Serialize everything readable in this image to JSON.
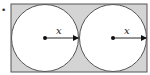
{
  "diagram": {
    "type": "geometry",
    "bullet": "•",
    "rectangle": {
      "fill": "#d4d4d4",
      "stroke": "#555555"
    },
    "circles": [
      {
        "id": "left",
        "fill": "#ffffff",
        "stroke": "#555555",
        "radius_label": "x"
      },
      {
        "id": "right",
        "fill": "#ffffff",
        "stroke": "#555555",
        "radius_label": "x"
      }
    ]
  }
}
